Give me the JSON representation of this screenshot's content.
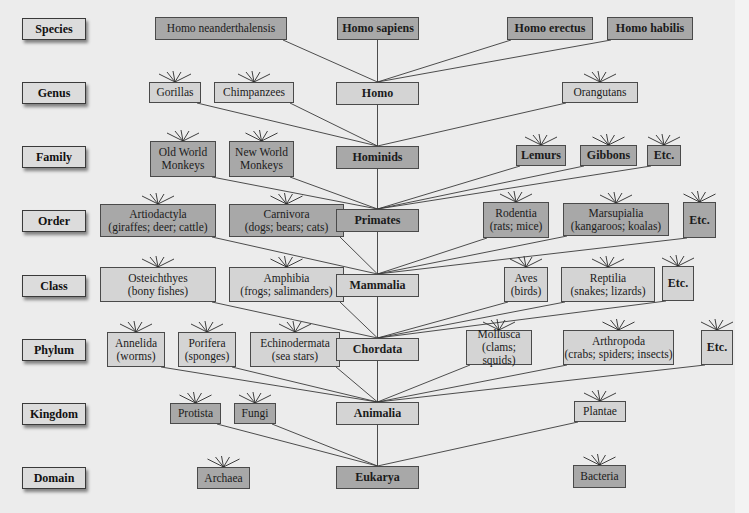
{
  "diagram": {
    "title_visible": false,
    "colors": {
      "background": "#ececec",
      "light_box": "#d4d4d4",
      "dark_box": "#a8a8a8",
      "line": "#3a3a3a"
    },
    "ranks": [
      {
        "label": "Species",
        "y": 18
      },
      {
        "label": "Genus",
        "y": 82
      },
      {
        "label": "Family",
        "y": 146
      },
      {
        "label": "Order",
        "y": 210
      },
      {
        "label": "Class",
        "y": 275
      },
      {
        "label": "Phylum",
        "y": 339
      },
      {
        "label": "Kingdom",
        "y": 403
      },
      {
        "label": "Domain",
        "y": 467
      }
    ],
    "nodes": [
      {
        "id": "neander",
        "label": "Homo neanderthalensis",
        "x": 155,
        "y": 17,
        "w": 132,
        "h": 23,
        "tone": "dark",
        "bold": false,
        "parent": "homo",
        "burst": false
      },
      {
        "id": "sapiens",
        "label": "Homo sapiens",
        "x": 337,
        "y": 17,
        "w": 82,
        "h": 23,
        "tone": "dark",
        "bold": true,
        "parent": "homo",
        "burst": false
      },
      {
        "id": "erectus",
        "label": "Homo erectus",
        "x": 507,
        "y": 17,
        "w": 86,
        "h": 23,
        "tone": "dark",
        "bold": true,
        "parent": "homo",
        "burst": false
      },
      {
        "id": "habilis",
        "label": "Homo habilis",
        "x": 607,
        "y": 17,
        "w": 86,
        "h": 23,
        "tone": "dark",
        "bold": true,
        "parent": "homo",
        "burst": false
      },
      {
        "id": "gorillas",
        "label": "Gorillas",
        "x": 149,
        "y": 82,
        "w": 52,
        "h": 21,
        "tone": "light",
        "bold": false,
        "parent": "hominids",
        "burst": true
      },
      {
        "id": "chimps",
        "label": "Chimpanzees",
        "x": 214,
        "y": 82,
        "w": 80,
        "h": 21,
        "tone": "light",
        "bold": false,
        "parent": "hominids",
        "burst": true
      },
      {
        "id": "homo",
        "label": "Homo",
        "x": 336,
        "y": 82,
        "w": 83,
        "h": 23,
        "tone": "light",
        "bold": true,
        "parent": "hominids",
        "burst": false
      },
      {
        "id": "orangutans",
        "label": "Orangutans",
        "x": 562,
        "y": 82,
        "w": 76,
        "h": 21,
        "tone": "light",
        "bold": false,
        "parent": "hominids",
        "burst": true
      },
      {
        "id": "owm",
        "label": "Old World\nMonkeys",
        "x": 150,
        "y": 141,
        "w": 66,
        "h": 36,
        "tone": "dark",
        "bold": false,
        "parent": "primates",
        "burst": true
      },
      {
        "id": "nwm",
        "label": "New World\nMonkeys",
        "x": 229,
        "y": 141,
        "w": 65,
        "h": 36,
        "tone": "dark",
        "bold": false,
        "parent": "primates",
        "burst": true
      },
      {
        "id": "hominids",
        "label": "Hominids",
        "x": 336,
        "y": 146,
        "w": 83,
        "h": 23,
        "tone": "dark",
        "bold": true,
        "parent": "primates",
        "burst": false
      },
      {
        "id": "lemurs",
        "label": "Lemurs",
        "x": 516,
        "y": 145,
        "w": 50,
        "h": 21,
        "tone": "dark",
        "bold": true,
        "parent": "primates",
        "burst": true
      },
      {
        "id": "gibbons",
        "label": "Gibbons",
        "x": 580,
        "y": 145,
        "w": 57,
        "h": 21,
        "tone": "dark",
        "bold": true,
        "parent": "primates",
        "burst": true
      },
      {
        "id": "fam_etc",
        "label": "Etc.",
        "x": 647,
        "y": 145,
        "w": 34,
        "h": 21,
        "tone": "dark",
        "bold": true,
        "parent": "primates",
        "burst": true
      },
      {
        "id": "artio",
        "label": "Artiodactyla\n(giraffes; deer; cattle)",
        "x": 100,
        "y": 204,
        "w": 116,
        "h": 33,
        "tone": "dark",
        "bold": false,
        "parent": "mammalia",
        "burst": true
      },
      {
        "id": "carni",
        "label": "Carnivora\n(dogs; bears; cats)",
        "x": 229,
        "y": 204,
        "w": 115,
        "h": 33,
        "tone": "dark",
        "bold": false,
        "parent": "mammalia",
        "burst": true
      },
      {
        "id": "primates",
        "label": "Primates",
        "x": 336,
        "y": 209,
        "w": 83,
        "h": 23,
        "tone": "dark",
        "bold": true,
        "parent": "mammalia",
        "burst": false
      },
      {
        "id": "rodentia",
        "label": "Rodentia\n(rats; mice)",
        "x": 483,
        "y": 202,
        "w": 66,
        "h": 36,
        "tone": "dark",
        "bold": false,
        "parent": "mammalia",
        "burst": true
      },
      {
        "id": "marsu",
        "label": "Marsupialia\n(kangaroos; koalas)",
        "x": 563,
        "y": 203,
        "w": 106,
        "h": 33,
        "tone": "dark",
        "bold": false,
        "parent": "mammalia",
        "burst": true
      },
      {
        "id": "ord_etc",
        "label": "Etc.",
        "x": 683,
        "y": 202,
        "w": 33,
        "h": 36,
        "tone": "dark",
        "bold": true,
        "parent": "mammalia",
        "burst": true
      },
      {
        "id": "osteich",
        "label": "Osteichthyes\n(bony fishes)",
        "x": 100,
        "y": 267,
        "w": 116,
        "h": 35,
        "tone": "light",
        "bold": false,
        "parent": "chordata",
        "burst": true
      },
      {
        "id": "amphibia",
        "label": "Amphibia\n(frogs; salimanders)",
        "x": 229,
        "y": 267,
        "w": 115,
        "h": 35,
        "tone": "light",
        "bold": false,
        "parent": "chordata",
        "burst": true
      },
      {
        "id": "mammalia",
        "label": "Mammalia",
        "x": 336,
        "y": 274,
        "w": 83,
        "h": 23,
        "tone": "light",
        "bold": true,
        "parent": "chordata",
        "burst": false
      },
      {
        "id": "aves",
        "label": "Aves\n(birds)",
        "x": 504,
        "y": 267,
        "w": 44,
        "h": 35,
        "tone": "light",
        "bold": false,
        "parent": "chordata",
        "burst": true
      },
      {
        "id": "reptilia",
        "label": "Reptilia\n(snakes; lizards)",
        "x": 561,
        "y": 267,
        "w": 94,
        "h": 35,
        "tone": "light",
        "bold": false,
        "parent": "chordata",
        "burst": true
      },
      {
        "id": "cls_etc",
        "label": "Etc.",
        "x": 662,
        "y": 266,
        "w": 32,
        "h": 35,
        "tone": "light",
        "bold": true,
        "parent": "chordata",
        "burst": true
      },
      {
        "id": "annelida",
        "label": "Annelida\n(worms)",
        "x": 107,
        "y": 332,
        "w": 58,
        "h": 35,
        "tone": "light",
        "bold": false,
        "parent": "animalia",
        "burst": true
      },
      {
        "id": "porifera",
        "label": "Porifera\n(sponges)",
        "x": 178,
        "y": 332,
        "w": 58,
        "h": 35,
        "tone": "light",
        "bold": false,
        "parent": "animalia",
        "burst": true
      },
      {
        "id": "echino",
        "label": "Echinodermata\n(sea stars)",
        "x": 250,
        "y": 332,
        "w": 90,
        "h": 35,
        "tone": "light",
        "bold": false,
        "parent": "animalia",
        "burst": true
      },
      {
        "id": "chordata",
        "label": "Chordata",
        "x": 336,
        "y": 338,
        "w": 83,
        "h": 23,
        "tone": "light",
        "bold": true,
        "parent": "animalia",
        "burst": false
      },
      {
        "id": "mollusca",
        "label": "Mollusca\n(clams; squids)",
        "x": 466,
        "y": 330,
        "w": 66,
        "h": 35,
        "tone": "light",
        "bold": false,
        "parent": "animalia",
        "burst": true
      },
      {
        "id": "arthro",
        "label": "Arthropoda\n(crabs; spiders; insects)",
        "x": 563,
        "y": 330,
        "w": 111,
        "h": 35,
        "tone": "light",
        "bold": false,
        "parent": "animalia",
        "burst": true
      },
      {
        "id": "phy_etc",
        "label": "Etc.",
        "x": 701,
        "y": 330,
        "w": 32,
        "h": 35,
        "tone": "light",
        "bold": true,
        "parent": "animalia",
        "burst": true
      },
      {
        "id": "protista",
        "label": "Protista",
        "x": 170,
        "y": 403,
        "w": 51,
        "h": 21,
        "tone": "dark",
        "bold": false,
        "parent": "eukarya",
        "burst": true
      },
      {
        "id": "fungi",
        "label": "Fungi",
        "x": 234,
        "y": 403,
        "w": 42,
        "h": 21,
        "tone": "dark",
        "bold": false,
        "parent": "eukarya",
        "burst": true
      },
      {
        "id": "animalia",
        "label": "Animalia",
        "x": 336,
        "y": 402,
        "w": 83,
        "h": 23,
        "tone": "light",
        "bold": true,
        "parent": "eukarya",
        "burst": false
      },
      {
        "id": "plantae",
        "label": "Plantae",
        "x": 574,
        "y": 401,
        "w": 52,
        "h": 21,
        "tone": "light",
        "bold": false,
        "parent": "eukarya",
        "burst": true
      },
      {
        "id": "archaea",
        "label": "Archaea",
        "x": 197,
        "y": 467,
        "w": 53,
        "h": 22,
        "tone": "dark",
        "bold": false,
        "parent": null,
        "burst": true
      },
      {
        "id": "eukarya",
        "label": "Eukarya",
        "x": 336,
        "y": 466,
        "w": 83,
        "h": 23,
        "tone": "dark",
        "bold": true,
        "parent": null,
        "burst": false
      },
      {
        "id": "bacteria",
        "label": "Bacteria",
        "x": 573,
        "y": 465,
        "w": 53,
        "h": 23,
        "tone": "dark",
        "bold": false,
        "parent": null,
        "burst": true
      }
    ]
  }
}
